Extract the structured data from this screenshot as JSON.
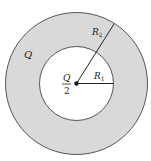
{
  "diagram": {
    "type": "concentric-shell-charge",
    "colors": {
      "shell_fill": "#d9d9d9",
      "inner_fill": "#ffffff",
      "stroke": "#555555",
      "background": "#ffffff"
    },
    "geometry": {
      "center": [
        76.5,
        83.5
      ],
      "outer_radius": 71,
      "inner_radius": 37
    },
    "labels": {
      "shell_charge": "Q",
      "center_charge_numerator": "Q",
      "center_charge_denominator": "2",
      "outer_radius": "R",
      "outer_radius_sub": "2",
      "inner_radius": "R",
      "inner_radius_sub": "1"
    }
  }
}
